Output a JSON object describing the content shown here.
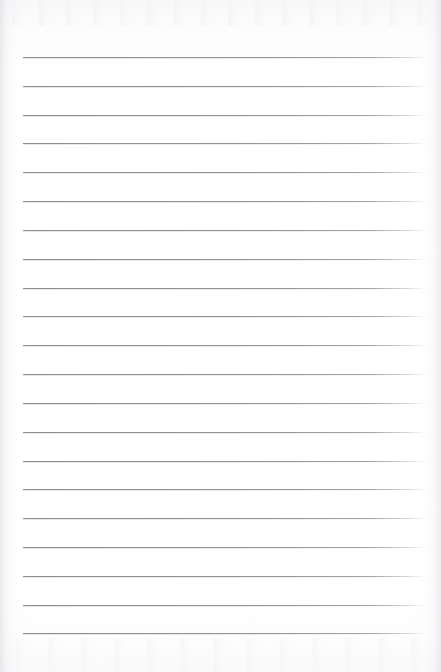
{
  "document": {
    "kind": "ruled-notebook-page",
    "title": "Blank lined notebook paper",
    "page_width": 441,
    "page_height": 672,
    "paper_color": "#fdfdfd",
    "has_visible_text": false,
    "written_content": "",
    "margin_rule": "none",
    "holes": "none",
    "header_text": "",
    "footer_text": ""
  },
  "rules": {
    "count": 21,
    "color": "#8a8c91",
    "thickness_px": 1,
    "first_line_y": 57,
    "spacing_px": 28.8,
    "line_start_x": 23,
    "line_end_x": 427,
    "right_end_fades": true,
    "positions_y": [
      57,
      86,
      115,
      143,
      172,
      201,
      230,
      259,
      288,
      316,
      345,
      374,
      403,
      432,
      461,
      489,
      518,
      547,
      576,
      605,
      633
    ]
  },
  "edges": {
    "left_shadow_color": "#d6d8dc",
    "right_shadow_color": "#dadce0",
    "top_band_color": "#f3f3f6",
    "bottom_band_color": "#f4f4f6"
  }
}
